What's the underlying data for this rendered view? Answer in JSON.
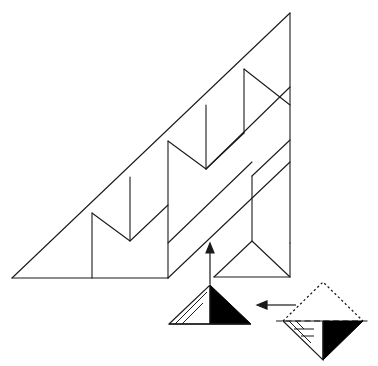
{
  "figure": {
    "background_color": "#ffffff",
    "stroke_color": "#1a1a1a",
    "fill_color": "#000000",
    "stroke_width": 1.1
  },
  "main_shape": {
    "name": "large-right-triangle-sawtooth",
    "left_vertex": [
      12,
      278
    ],
    "apex_vertex": [
      290,
      13
    ],
    "bottom_right_vertex": [
      290,
      243
    ],
    "description": "Large right triangle filled with a zigzag sawtooth band tessellation of congruent right triangles"
  },
  "geometry": {
    "outline": "M12,278 L290,13 L290,243 L168,243 L168,278 Z",
    "band_step": 37,
    "rows": 3,
    "vertical_lines": [
      {
        "x": 92,
        "y1": 213,
        "y2": 278
      },
      {
        "x": 130,
        "y1": 177,
        "y2": 241
      },
      {
        "x": 168,
        "y1": 141,
        "y2": 278
      },
      {
        "x": 206,
        "y1": 105,
        "y2": 169
      },
      {
        "x": 244,
        "y1": 69,
        "y2": 133
      },
      {
        "x": 252,
        "y1": 176,
        "y2": 241
      },
      {
        "x": 290,
        "y1": 13,
        "y2": 243
      }
    ],
    "zigzag_paths": [
      "M12,278 L290,13",
      "M92,213 L130,241 L168,205 L206,233",
      "M130,177 L168,205",
      "M168,141 L206,169 L244,133 L282,161",
      "M206,105 L244,133",
      "M244,69 L290,105",
      "M168,243 L290,123",
      "M214,277 L252,241 L290,277",
      "M252,176 L290,140"
    ],
    "bottom_edge": "M12,278 L168,278",
    "lower_right_band": "M168,243 L290,243"
  },
  "small_figure_center": {
    "name": "unfolded-triangle",
    "base_left": [
      170,
      323
    ],
    "base_right": [
      250,
      323
    ],
    "apex": [
      210,
      285
    ],
    "black_half": "M210,285 L250,323 L210,323 Z",
    "thin_lines": [
      "M170,323 L210,285",
      "M176,323 L207,291",
      "M183,323 L203,300",
      "M170,323 L210,323"
    ]
  },
  "small_figure_right": {
    "name": "folded-diamond",
    "top_vertex": [
      323,
      283
    ],
    "left_vertex": [
      283,
      321
    ],
    "right_vertex": [
      363,
      321
    ],
    "bottom_vertex": [
      323,
      359
    ],
    "dotted_upper": "M283,321 L323,283 L363,321",
    "dashed_midline": [
      [
        276,
        321
      ],
      [
        370,
        321
      ]
    ],
    "black_region": "M323,321 L363,321 L323,359 Z",
    "solid_lower_left": "M283,321 L323,359 L323,321",
    "inner_lines": [
      "M289,321 L310,342",
      "M296,321 L303,328",
      "M294,328 L313,328"
    ]
  },
  "arrows": [
    {
      "name": "up-arrow",
      "direction": "up",
      "from": [
        210,
        282
      ],
      "to": [
        210,
        244
      ],
      "head_at": [
        210,
        244
      ]
    },
    {
      "name": "left-arrow",
      "direction": "left",
      "from": [
        295,
        305
      ],
      "to": [
        258,
        305
      ],
      "head_at": [
        258,
        305
      ]
    }
  ]
}
